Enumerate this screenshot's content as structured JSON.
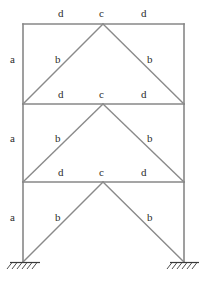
{
  "diagram": {
    "line_color": "#878787",
    "support_color": "#3a3a3a",
    "label_color": "#2b2b2b",
    "background": "#ffffff"
  },
  "labels": {
    "column": "a",
    "brace": "b",
    "apex": "c",
    "beam": "d"
  },
  "stories": [
    {
      "name": "upper-story",
      "beam_left_label": "d",
      "apex_label": "c",
      "beam_right_label": "d",
      "column_label": "a",
      "brace_left_label": "b",
      "brace_right_label": "b"
    },
    {
      "name": "middle-story",
      "beam_left_label": "d",
      "apex_label": "c",
      "beam_right_label": "d",
      "column_label": "a",
      "brace_left_label": "b",
      "brace_right_label": "b"
    },
    {
      "name": "lower-story",
      "beam_left_label": "d",
      "apex_label": "c",
      "beam_right_label": "d",
      "column_label": "a",
      "brace_left_label": "b",
      "brace_right_label": "b"
    }
  ],
  "supports": [
    {
      "name": "left-fixed-support",
      "type": "fixed"
    },
    {
      "name": "right-fixed-support",
      "type": "fixed"
    }
  ],
  "label_positions": {
    "top_beam_left_d": {
      "x": 58,
      "y": 8
    },
    "top_apex_c": {
      "x": 99,
      "y": 8
    },
    "top_beam_right_d": {
      "x": 141,
      "y": 8
    },
    "upper_col_a": {
      "x": 10,
      "y": 54
    },
    "upper_brace_left_b": {
      "x": 55,
      "y": 54
    },
    "upper_brace_right_b": {
      "x": 147,
      "y": 54
    },
    "mid1_beam_left_d": {
      "x": 58,
      "y": 89
    },
    "mid1_apex_c": {
      "x": 99,
      "y": 89
    },
    "mid1_beam_right_d": {
      "x": 141,
      "y": 89
    },
    "middle_col_a": {
      "x": 10,
      "y": 133
    },
    "middle_brace_left_b": {
      "x": 55,
      "y": 133
    },
    "middle_brace_right_b": {
      "x": 147,
      "y": 133
    },
    "mid2_beam_left_d": {
      "x": 58,
      "y": 167
    },
    "mid2_apex_c": {
      "x": 99,
      "y": 167
    },
    "mid2_beam_right_d": {
      "x": 141,
      "y": 167
    },
    "lower_col_a": {
      "x": 10,
      "y": 212
    },
    "lower_brace_left_b": {
      "x": 55,
      "y": 212
    },
    "lower_brace_right_b": {
      "x": 147,
      "y": 212
    }
  },
  "geometry": {
    "left_column_x": 23,
    "right_column_x": 184,
    "apex_x": 103,
    "level_top_y": 24,
    "level_mid1_y": 104,
    "level_mid2_y": 182,
    "level_base_y": 262
  }
}
